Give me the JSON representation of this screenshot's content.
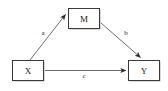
{
  "diagram": {
    "type": "mediation-path-diagram",
    "background_color": "#ffffff",
    "box_stroke_color": "#3a3a3a",
    "box_fill_color": "#ffffff",
    "box_shadow_color": "#b4b4b4",
    "edge_color": "#6e6e6e",
    "text_color": "#1a1a1a",
    "nodes": [
      {
        "id": "M",
        "label": "M",
        "x": 84,
        "y": 18
      },
      {
        "id": "X",
        "label": "X",
        "x": 28,
        "y": 71
      },
      {
        "id": "Y",
        "label": "Y",
        "x": 144,
        "y": 71
      }
    ],
    "edges": [
      {
        "id": "a",
        "label": "a",
        "from": "X",
        "to": "M",
        "label_x": 43,
        "label_y": 33
      },
      {
        "id": "b",
        "label": "b",
        "from": "M",
        "to": "Y",
        "label_x": 126,
        "label_y": 33
      },
      {
        "id": "c",
        "label": "c",
        "from": "X",
        "to": "Y",
        "label_x": 84,
        "label_y": 75
      }
    ]
  }
}
